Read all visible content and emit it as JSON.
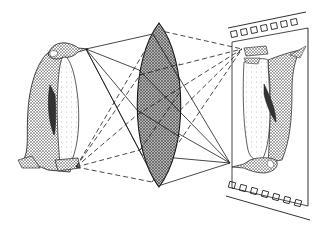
{
  "diagram": {
    "lens": "converging lens",
    "image_medium": "film strip",
    "image_orientation": "inverted",
    "colors": {
      "ink": "#1a1a1a",
      "lens_fill": "#8a8a8a",
      "paper": "#ffffff"
    },
    "film_sprocket_holes_top": 7,
    "film_sprocket_holes_bottom": 7
  }
}
